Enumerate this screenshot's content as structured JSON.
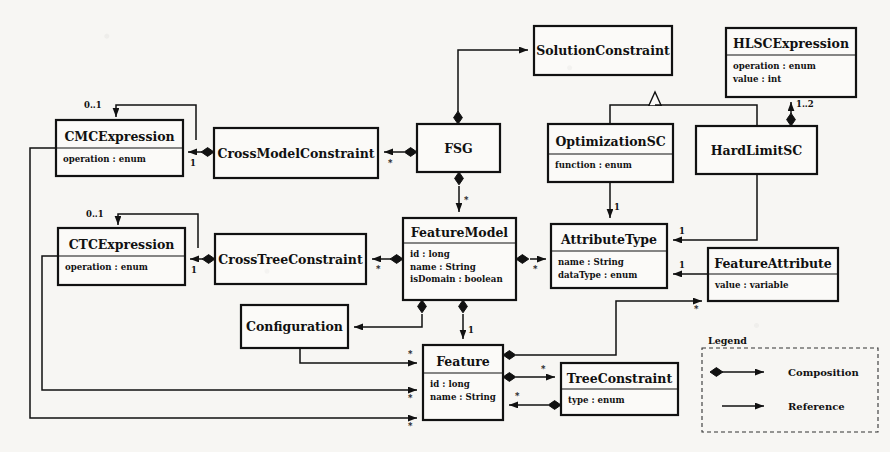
{
  "diagram": {
    "background_color": "#f7f6f3",
    "line_color": "#111111",
    "box_fill": "#fbfaf8"
  },
  "classes": [
    {
      "id": "solutionconstraint",
      "name": "SolutionConstraint",
      "attributes": [],
      "x": 534,
      "y": 26,
      "w": 138,
      "h": 49
    },
    {
      "id": "hlscexpression",
      "name": "HLSCExpression",
      "attributes": [
        "operation : enum",
        "value : int"
      ],
      "x": 726,
      "y": 28,
      "w": 130,
      "h": 69,
      "header_h": 27
    },
    {
      "id": "cmcexpression",
      "name": "CMCExpression",
      "attributes": [
        "operation : enum"
      ],
      "x": 56,
      "y": 120,
      "w": 127,
      "h": 56,
      "header_h": 28
    },
    {
      "id": "crossmodelconstraint",
      "name": "CrossModelConstraint",
      "attributes": [],
      "x": 214,
      "y": 128,
      "w": 164,
      "h": 50
    },
    {
      "id": "fsg",
      "name": "FSG",
      "attributes": [],
      "x": 417,
      "y": 124,
      "w": 83,
      "h": 48
    },
    {
      "id": "optimizationsc",
      "name": "OptimizationSC",
      "attributes": [
        "function : enum"
      ],
      "x": 548,
      "y": 124,
      "w": 125,
      "h": 58,
      "header_h": 30
    },
    {
      "id": "hardlimitsc",
      "name": "HardLimitSC",
      "attributes": [],
      "x": 696,
      "y": 126,
      "w": 121,
      "h": 48
    },
    {
      "id": "ctcexpression",
      "name": "CTCExpression",
      "attributes": [
        "operation : enum"
      ],
      "x": 58,
      "y": 228,
      "w": 127,
      "h": 57,
      "header_h": 28
    },
    {
      "id": "crosstreeconstraint",
      "name": "CrossTreeConstraint",
      "attributes": [],
      "x": 215,
      "y": 234,
      "w": 151,
      "h": 50
    },
    {
      "id": "featuremodel",
      "name": "FeatureModel",
      "attributes": [
        "id : long",
        "name : String",
        "isDomain : boolean"
      ],
      "x": 403,
      "y": 218,
      "w": 113,
      "h": 82,
      "header_h": 25
    },
    {
      "id": "attributetype",
      "name": "AttributeType",
      "attributes": [
        "name : String",
        "dataType : enum"
      ],
      "x": 551,
      "y": 224,
      "w": 116,
      "h": 64,
      "header_h": 27
    },
    {
      "id": "featureattribute",
      "name": "FeatureAttribute",
      "attributes": [
        "value : variable"
      ],
      "x": 708,
      "y": 248,
      "w": 130,
      "h": 53,
      "header_h": 26
    },
    {
      "id": "configuration",
      "name": "Configuration",
      "attributes": [],
      "x": 241,
      "y": 305,
      "w": 107,
      "h": 43
    },
    {
      "id": "feature",
      "name": "Feature",
      "attributes": [
        "id : long",
        "name : String"
      ],
      "x": 423,
      "y": 345,
      "w": 80,
      "h": 75,
      "header_h": 28
    },
    {
      "id": "treeconstraint",
      "name": "TreeConstraint",
      "attributes": [
        "type : enum"
      ],
      "x": 561,
      "y": 363,
      "w": 117,
      "h": 52,
      "header_h": 26
    }
  ],
  "edges": [
    {
      "id": "fsg-solutionconstraint",
      "kind": "composition",
      "source": "fsg",
      "target": "solutionconstraint",
      "source_mult": "",
      "target_mult": ""
    },
    {
      "id": "solutionconstraint-optimizationsc",
      "kind": "generalization",
      "source": "optimizationsc",
      "target": "solutionconstraint",
      "source_mult": "",
      "target_mult": ""
    },
    {
      "id": "solutionconstraint-hardlimitsc",
      "kind": "generalization",
      "source": "hardlimitsc",
      "target": "solutionconstraint",
      "source_mult": "",
      "target_mult": ""
    },
    {
      "id": "hardlimitsc-hlscexpression",
      "kind": "composition",
      "source": "hardlimitsc",
      "target": "hlscexpression",
      "source_mult": "",
      "target_mult": "1..2"
    },
    {
      "id": "cmcexpression-self",
      "kind": "composition",
      "source": "cmcexpression",
      "target": "cmcexpression",
      "source_mult": "",
      "target_mult": "0..1"
    },
    {
      "id": "crossmodelconstraint-cmcexpression",
      "kind": "composition",
      "source": "crossmodelconstraint",
      "target": "cmcexpression",
      "source_mult": "",
      "target_mult": "1"
    },
    {
      "id": "fsg-crossmodelconstraint",
      "kind": "composition",
      "source": "fsg",
      "target": "crossmodelconstraint",
      "source_mult": "",
      "target_mult": "*"
    },
    {
      "id": "fsg-featuremodel",
      "kind": "composition",
      "source": "fsg",
      "target": "featuremodel",
      "source_mult": "",
      "target_mult": "*"
    },
    {
      "id": "ctcexpression-self",
      "kind": "composition",
      "source": "ctcexpression",
      "target": "ctcexpression",
      "source_mult": "",
      "target_mult": "0..1"
    },
    {
      "id": "crosstreeconstraint-ctcexpression",
      "kind": "composition",
      "source": "crosstreeconstraint",
      "target": "ctcexpression",
      "source_mult": "",
      "target_mult": "1"
    },
    {
      "id": "featuremodel-crosstreeconstraint",
      "kind": "composition",
      "source": "featuremodel",
      "target": "crosstreeconstraint",
      "source_mult": "",
      "target_mult": "*"
    },
    {
      "id": "featuremodel-attributetype",
      "kind": "composition",
      "source": "featuremodel",
      "target": "attributetype",
      "source_mult": "",
      "target_mult": "*"
    },
    {
      "id": "optimizationsc-attributetype",
      "kind": "reference",
      "source": "optimizationsc",
      "target": "attributetype",
      "source_mult": "",
      "target_mult": "1"
    },
    {
      "id": "hardlimitsc-attributetype",
      "kind": "reference",
      "source": "hardlimitsc",
      "target": "attributetype",
      "source_mult": "",
      "target_mult": "1"
    },
    {
      "id": "featureattribute-attributetype",
      "kind": "reference",
      "source": "featureattribute",
      "target": "attributetype",
      "source_mult": "",
      "target_mult": "1"
    },
    {
      "id": "featuremodel-configuration",
      "kind": "composition",
      "source": "featuremodel",
      "target": "configuration",
      "source_mult": "",
      "target_mult": ""
    },
    {
      "id": "featuremodel-feature",
      "kind": "composition",
      "source": "featuremodel",
      "target": "feature",
      "source_mult": "",
      "target_mult": "1"
    },
    {
      "id": "configuration-feature",
      "kind": "reference",
      "source": "configuration",
      "target": "feature",
      "source_mult": "",
      "target_mult": "*"
    },
    {
      "id": "feature-featureattribute",
      "kind": "composition",
      "source": "feature",
      "target": "featureattribute",
      "source_mult": "",
      "target_mult": "*"
    },
    {
      "id": "feature-treeconstraint",
      "kind": "composition",
      "source": "feature",
      "target": "treeconstraint",
      "source_mult": "",
      "target_mult": "*"
    },
    {
      "id": "treeconstraint-feature",
      "kind": "composition",
      "source": "treeconstraint",
      "target": "feature",
      "source_mult": "",
      "target_mult": "*"
    },
    {
      "id": "cmcexpression-feature",
      "kind": "reference",
      "source": "cmcexpression",
      "target": "feature",
      "source_mult": "",
      "target_mult": "*"
    },
    {
      "id": "ctcexpression-feature",
      "kind": "reference",
      "source": "ctcexpression",
      "target": "feature",
      "source_mult": "",
      "target_mult": "*"
    }
  ],
  "legend": {
    "title": "Legend",
    "x": 702,
    "y": 348,
    "w": 176,
    "h": 84,
    "items": [
      {
        "id": "legend-composition",
        "label": "Composition",
        "kind": "composition"
      },
      {
        "id": "legend-reference",
        "label": "Reference",
        "kind": "reference"
      }
    ]
  },
  "multiplicity_labels": {
    "zero_one": "0..1",
    "one": "1",
    "many": "*",
    "one_to_two": "1..2"
  }
}
